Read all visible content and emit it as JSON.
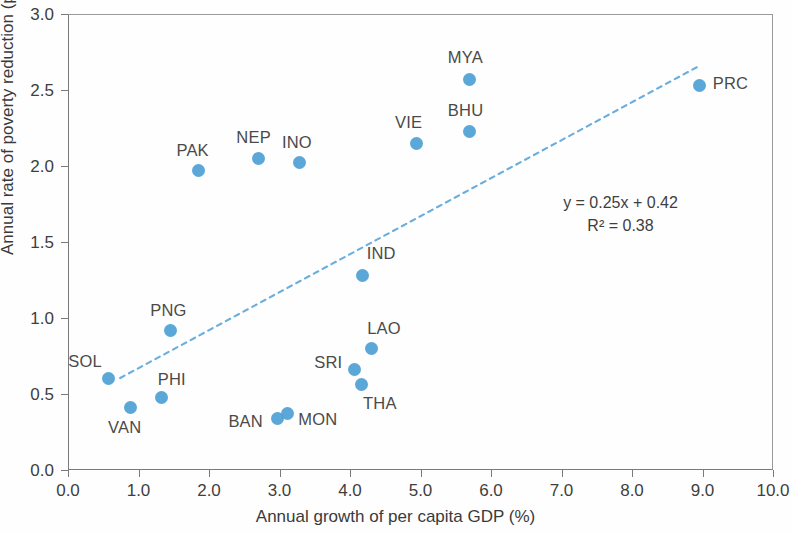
{
  "chart_data": {
    "type": "scatter",
    "title": "",
    "xlabel": "Annual growth of per capita GDP (%)",
    "ylabel": "Annual rate of poverty reduction (p.p.)",
    "xlim": [
      0.0,
      10.0
    ],
    "ylim": [
      0.0,
      3.0
    ],
    "xticks": [
      "0.0",
      "1.0",
      "2.0",
      "3.0",
      "4.0",
      "5.0",
      "6.0",
      "7.0",
      "8.0",
      "9.0",
      "10.0"
    ],
    "yticks": [
      "0.0",
      "0.5",
      "1.0",
      "1.5",
      "2.0",
      "2.5",
      "3.0"
    ],
    "xtick_values": [
      0.0,
      1.0,
      2.0,
      3.0,
      4.0,
      5.0,
      6.0,
      7.0,
      8.0,
      9.0,
      10.0
    ],
    "ytick_values": [
      0.0,
      0.5,
      1.0,
      1.5,
      2.0,
      2.5,
      3.0
    ],
    "grid": false,
    "legend": "none",
    "marker_color": "#4d9fd4",
    "trendline": {
      "style": "dashed",
      "color": "#6aaedd",
      "equation": "y = 0.25x + 0.42",
      "r_squared_label": "R² = 0.38",
      "slope": 0.25,
      "intercept": 0.42,
      "r_squared": 0.38,
      "x_start": 0.74,
      "x_end": 8.96
    },
    "points": [
      {
        "label": "SOL",
        "x": 0.57,
        "y": 0.6,
        "label_dx": -40,
        "label_dy": -26
      },
      {
        "label": "VAN",
        "x": 0.88,
        "y": 0.41,
        "label_dx": -22,
        "label_dy": 11
      },
      {
        "label": "PHI",
        "x": 1.33,
        "y": 0.48,
        "label_dx": -4,
        "label_dy": -26
      },
      {
        "label": "PNG",
        "x": 1.45,
        "y": 0.92,
        "label_dx": -20,
        "label_dy": -28
      },
      {
        "label": "PAK",
        "x": 1.85,
        "y": 1.97,
        "label_dx": -22,
        "label_dy": -29
      },
      {
        "label": "NEP",
        "x": 2.7,
        "y": 2.05,
        "label_dx": -22,
        "label_dy": -29
      },
      {
        "label": "BAN",
        "x": 2.97,
        "y": 0.34,
        "label_dx": -49,
        "label_dy": -5
      },
      {
        "label": "MON",
        "x": 3.11,
        "y": 0.37,
        "label_dx": 11,
        "label_dy": -3
      },
      {
        "label": "INO",
        "x": 3.29,
        "y": 2.02,
        "label_dx": -18,
        "label_dy": -29
      },
      {
        "label": "SRI",
        "x": 4.06,
        "y": 0.66,
        "label_dx": -40,
        "label_dy": -16
      },
      {
        "label": "THA",
        "x": 4.17,
        "y": 0.56,
        "label_dx": 1,
        "label_dy": 10
      },
      {
        "label": "IND",
        "x": 4.18,
        "y": 1.28,
        "label_dx": 4,
        "label_dy": -30
      },
      {
        "label": "LAO",
        "x": 4.3,
        "y": 0.8,
        "label_dx": -4,
        "label_dy": -28
      },
      {
        "label": "VIE",
        "x": 4.95,
        "y": 2.15,
        "label_dx": -22,
        "label_dy": -29
      },
      {
        "label": "BHU",
        "x": 5.7,
        "y": 2.23,
        "label_dx": -22,
        "label_dy": -29
      },
      {
        "label": "MYA",
        "x": 5.7,
        "y": 2.57,
        "label_dx": -22,
        "label_dy": -30
      },
      {
        "label": "PRC",
        "x": 8.96,
        "y": 2.53,
        "label_dx": 13,
        "label_dy": -10
      }
    ]
  }
}
